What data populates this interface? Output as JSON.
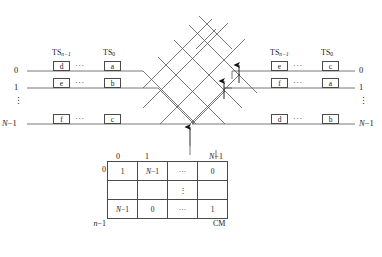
{
  "diagram": {
    "type": "switching-network-schematic",
    "line_color": "#555555",
    "box_border_color": "#4a4a4a"
  },
  "ts_headers": {
    "left": [
      {
        "base": "TS",
        "sub": "n−1"
      },
      {
        "base": "TS",
        "sub": "0"
      }
    ],
    "right": [
      {
        "base": "TS",
        "sub": "n−1"
      },
      {
        "base": "TS",
        "sub": "0"
      }
    ]
  },
  "input_lines": {
    "labels": [
      "0",
      "1",
      "⋮",
      "N−1"
    ],
    "rows": [
      {
        "label": "0",
        "cells": [
          "d",
          "a"
        ],
        "ellipsis": "···"
      },
      {
        "label": "1",
        "cells": [
          "e",
          "b"
        ],
        "ellipsis": "···"
      },
      {
        "label": "N−1",
        "cells": [
          "f",
          "c"
        ],
        "ellipsis": "···"
      }
    ]
  },
  "output_lines": {
    "labels": [
      "0",
      "1",
      "⋮",
      "N−1"
    ],
    "rows": [
      {
        "label": "0",
        "cells": [
          "e",
          "c"
        ],
        "ellipsis": "···"
      },
      {
        "label": "1",
        "cells": [
          "f",
          "a"
        ],
        "ellipsis": "···"
      },
      {
        "label": "N−1",
        "cells": [
          "d",
          "b"
        ],
        "ellipsis": "···"
      }
    ]
  },
  "control_memory": {
    "name": "CM",
    "column_headers": [
      "0",
      "1",
      "",
      "N−1"
    ],
    "row_headers": [
      "0",
      "",
      "n−1"
    ],
    "cells": [
      [
        "1",
        "N−1",
        "···",
        "0"
      ],
      [
        "",
        "",
        "⋮",
        ""
      ],
      [
        "N−1",
        "0",
        "···",
        "1"
      ]
    ]
  },
  "arrows": [
    {
      "name": "control-arrow-to-crossbar",
      "direction": "up"
    },
    {
      "name": "control-arrow-output-row-1",
      "direction": "up"
    },
    {
      "name": "control-arrow-output-row-0",
      "direction": "up"
    }
  ]
}
